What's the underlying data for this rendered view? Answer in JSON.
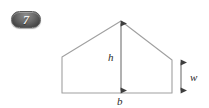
{
  "badge": {
    "number": "7",
    "color": "#4a4a4a",
    "text_color": "#f2f2f2"
  },
  "figure": {
    "name": "pentagon-barn-cross-section",
    "stroke_color": "#9a9a9a",
    "arrow_color": "#4d4d4d",
    "labels": {
      "height": "h",
      "base": "b",
      "wall": "w"
    },
    "geometry": {
      "apex": [
        121,
        21
      ],
      "left_eave": [
        62,
        57
      ],
      "right_eave": [
        172,
        60
      ],
      "left_base": [
        62,
        93
      ],
      "right_base": [
        172,
        93
      ],
      "height_arrow": {
        "x": 121,
        "y1": 21,
        "y2": 93
      },
      "wall_arrow": {
        "x": 181,
        "y1": 60,
        "y2": 93
      },
      "base_line": {
        "y": 93,
        "x1": 62,
        "x2": 172
      }
    }
  }
}
